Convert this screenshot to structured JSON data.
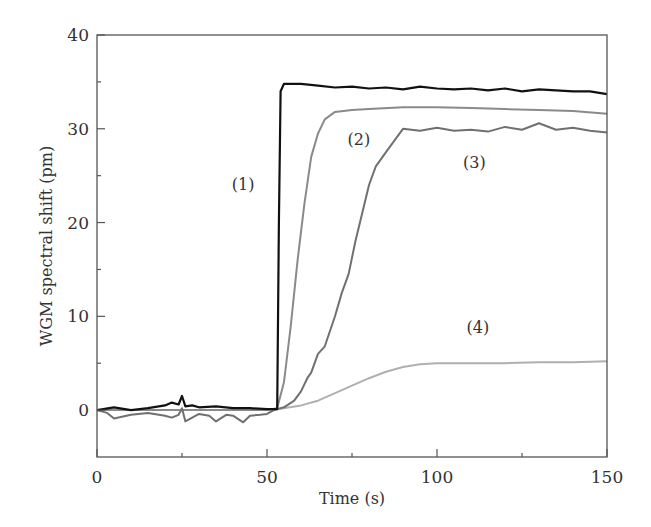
{
  "chart_data": {
    "type": "line",
    "title": "",
    "xlabel": "Time (s)",
    "ylabel": "WGM spectral shift (pm)",
    "xlim": [
      0,
      150
    ],
    "ylim": [
      -5,
      40
    ],
    "xticks": [
      0,
      50,
      100,
      150
    ],
    "xticks_minor": [
      25,
      75,
      125
    ],
    "yticks": [
      0,
      10,
      20,
      30,
      40
    ],
    "yticks_minor": [
      5,
      15,
      25,
      35
    ],
    "grid": false,
    "legend": "none (inline annotations)",
    "series": [
      {
        "name": "(1)",
        "color": "#111111",
        "x": [
          0,
          5,
          10,
          15,
          20,
          22,
          24,
          25,
          26,
          28,
          30,
          35,
          40,
          45,
          50,
          52,
          53,
          53.5,
          54,
          55,
          60,
          65,
          70,
          75,
          80,
          85,
          90,
          95,
          100,
          105,
          110,
          115,
          120,
          125,
          130,
          135,
          140,
          145,
          150
        ],
        "y": [
          0,
          0.3,
          0,
          0.2,
          0.5,
          0.8,
          0.6,
          1.5,
          0.4,
          0.5,
          0.3,
          0.4,
          0.2,
          0.2,
          0.1,
          0.1,
          0.1,
          20,
          34,
          34.8,
          34.8,
          34.6,
          34.4,
          34.5,
          34.3,
          34.4,
          34.2,
          34.5,
          34.3,
          34.2,
          34.3,
          34.1,
          34.3,
          34.0,
          34.2,
          34.1,
          34.0,
          34.0,
          33.7
        ]
      },
      {
        "name": "(2)",
        "color": "#8a8a8a",
        "x": [
          0,
          10,
          20,
          30,
          40,
          50,
          53,
          55,
          57,
          59,
          61,
          63,
          65,
          67,
          70,
          75,
          80,
          90,
          100,
          110,
          120,
          130,
          140,
          150
        ],
        "y": [
          0,
          0,
          0,
          0,
          0,
          0,
          0.2,
          3,
          9,
          16,
          22,
          27,
          29.5,
          31,
          31.8,
          32.0,
          32.1,
          32.3,
          32.3,
          32.2,
          32.1,
          32.0,
          31.9,
          31.6
        ]
      },
      {
        "name": "(3)",
        "color": "#707070",
        "x": [
          0,
          3,
          5,
          10,
          15,
          20,
          22,
          24,
          25,
          26,
          30,
          33,
          35,
          38,
          40,
          43,
          45,
          48,
          50,
          52,
          55,
          58,
          60,
          62,
          63,
          65,
          67,
          70,
          72,
          74,
          76,
          78,
          80,
          82,
          85,
          88,
          90,
          95,
          100,
          105,
          110,
          115,
          120,
          125,
          130,
          135,
          140,
          145,
          150
        ],
        "y": [
          0,
          -0.3,
          -0.9,
          -0.5,
          -0.3,
          -0.6,
          -0.8,
          -0.5,
          0.2,
          -1.2,
          -0.4,
          -0.6,
          -1.2,
          -0.5,
          -0.6,
          -1.3,
          -0.6,
          -0.5,
          -0.4,
          0,
          0.3,
          1,
          2,
          3.5,
          4,
          6,
          6.8,
          10,
          12.5,
          14.5,
          18,
          21,
          24,
          26,
          27.5,
          29,
          30,
          29.8,
          30.1,
          29.8,
          29.9,
          29.7,
          30.2,
          29.9,
          30.6,
          29.9,
          30.1,
          29.8,
          29.6
        ]
      },
      {
        "name": "(4)",
        "color": "#b0b0b0",
        "x": [
          0,
          10,
          20,
          30,
          40,
          50,
          53,
          60,
          65,
          70,
          75,
          80,
          85,
          90,
          95,
          100,
          110,
          120,
          130,
          140,
          150
        ],
        "y": [
          0,
          0,
          0,
          0,
          0,
          0,
          0.1,
          0.5,
          1.0,
          1.8,
          2.6,
          3.4,
          4.1,
          4.6,
          4.9,
          5.0,
          5.0,
          5.0,
          5.1,
          5.1,
          5.2
        ]
      }
    ],
    "annotations": [
      {
        "text": "(1)",
        "x": 43,
        "y": 23.5
      },
      {
        "text": "(2)",
        "x": 77,
        "y": 28.3
      },
      {
        "text": "(3)",
        "x": 111,
        "y": 25.8
      },
      {
        "text": "(4)",
        "x": 112,
        "y": 8.2
      }
    ]
  },
  "labels": {
    "xlabel": "Time (s)",
    "ylabel": "WGM spectral shift (pm)",
    "xtick_labels": [
      "0",
      "50",
      "100",
      "150"
    ],
    "ytick_labels": [
      "0",
      "10",
      "20",
      "30",
      "40"
    ]
  }
}
